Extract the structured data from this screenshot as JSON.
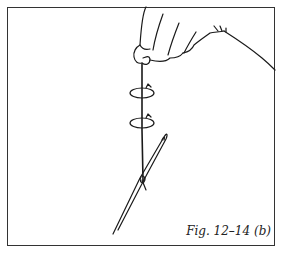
{
  "figure": {
    "caption": "Fig. 12–14  (b)",
    "colors": {
      "line": "#1a1a1a",
      "frame": "#333333",
      "background": "#ffffff"
    }
  }
}
